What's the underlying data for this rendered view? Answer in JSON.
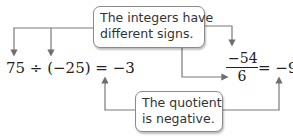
{
  "callouts": {
    "top": {
      "line1": "The integers have",
      "line2": "different signs."
    },
    "bottom": {
      "line1": "The quotient",
      "line2": "is negative."
    }
  },
  "example1": {
    "expression": "75 ÷ (−25) = −3"
  },
  "example2": {
    "numerator": "−54",
    "denominator": "6",
    "result": "= −9"
  },
  "colors": {
    "arrow": "#7a7a7a",
    "text": "#222222",
    "border": "#8a8a8a"
  }
}
